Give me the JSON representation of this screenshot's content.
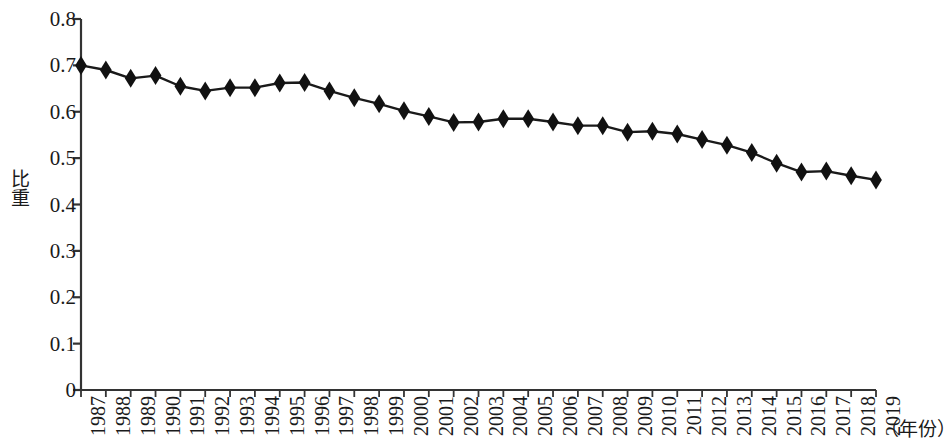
{
  "chart_data": {
    "type": "line",
    "title": "",
    "subtitle": "",
    "xlabel": "（年份）",
    "ylabel": "比重",
    "grid": false,
    "legend": false,
    "marker": "diamond",
    "line_color": "#1a1a1a",
    "marker_color": "#111111",
    "axis_color": "#333333",
    "ylim": [
      0,
      0.8
    ],
    "ytick_labels": [
      "0.8",
      "0.7",
      "0.6",
      "0.5",
      "0.4",
      "0.3",
      "0.2",
      "0.1",
      "0"
    ],
    "ytick_values": [
      0.8,
      0.7,
      0.6,
      0.5,
      0.4,
      0.3,
      0.2,
      0.1,
      0
    ],
    "categories": [
      "1987",
      "1988",
      "1989",
      "1990",
      "1991",
      "1992",
      "1993",
      "1994",
      "1995",
      "1996",
      "1997",
      "1998",
      "1999",
      "2000",
      "2001",
      "2002",
      "2003",
      "2004",
      "2005",
      "2006",
      "2007",
      "2008",
      "2009",
      "2010",
      "2011",
      "2012",
      "2013",
      "2014",
      "2015",
      "2016",
      "2017",
      "2018",
      "2019"
    ],
    "values": [
      0.7,
      0.69,
      0.672,
      0.678,
      0.655,
      0.645,
      0.652,
      0.652,
      0.662,
      0.663,
      0.645,
      0.63,
      0.617,
      0.602,
      0.59,
      0.577,
      0.578,
      0.585,
      0.585,
      0.578,
      0.57,
      0.57,
      0.556,
      0.558,
      0.552,
      0.54,
      0.528,
      0.512,
      0.489,
      0.47,
      0.472,
      0.462,
      0.453
    ],
    "series": [
      {
        "name": "比重",
        "values": [
          0.7,
          0.69,
          0.672,
          0.678,
          0.655,
          0.645,
          0.652,
          0.652,
          0.662,
          0.663,
          0.645,
          0.63,
          0.617,
          0.602,
          0.59,
          0.577,
          0.578,
          0.585,
          0.585,
          0.578,
          0.57,
          0.57,
          0.556,
          0.558,
          0.552,
          0.54,
          0.528,
          0.512,
          0.489,
          0.47,
          0.472,
          0.462,
          0.453
        ]
      }
    ]
  }
}
